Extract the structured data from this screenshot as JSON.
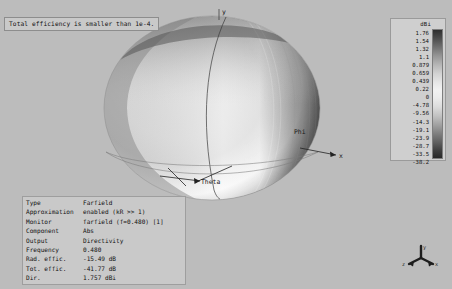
{
  "window": {
    "title": "Farfield 3D Plot"
  },
  "warning": {
    "text": "Total efficiency is smaller than 1e-4."
  },
  "plot": {
    "axis_labels": {
      "phi": "Phi",
      "theta": "Theta",
      "x": "x",
      "y": "y"
    },
    "triad": {
      "x": "x",
      "y": "y",
      "z": "z"
    }
  },
  "legend": {
    "title": "dBi",
    "ticks": [
      "1.76",
      "1.54",
      "1.32",
      "1.1",
      "0.879",
      "0.659",
      "0.439",
      "0.22",
      "0",
      "-4.78",
      "-9.56",
      "-14.3",
      "-19.1",
      "-23.9",
      "-28.7",
      "-33.5",
      "-38.2"
    ]
  },
  "parameters": {
    "rows": [
      {
        "label": "Type",
        "value": "Farfield"
      },
      {
        "label": "Approximation",
        "value": "enabled (kR >> 1)"
      },
      {
        "label": "Monitor",
        "value": "farfield (f=0.480) [1]"
      },
      {
        "label": "Component",
        "value": "Abs"
      },
      {
        "label": "Output",
        "value": "Directivity"
      },
      {
        "label": "Frequency",
        "value": "0.480"
      },
      {
        "label": "Rad. effic.",
        "value": "-15.49 dB"
      },
      {
        "label": "Tot. effic.",
        "value": "-41.77 dB"
      },
      {
        "label": "Dir.",
        "value": "1.757 dBi"
      }
    ]
  },
  "chart_data": {
    "type": "heatmap",
    "colormap": "grayscale",
    "units": "dBi",
    "colorbar_max": 1.76,
    "colorbar_min": -38.2,
    "colorbar_ticks": [
      1.76,
      1.54,
      1.32,
      1.1,
      0.879,
      0.659,
      0.439,
      0.22,
      0,
      -4.78,
      -9.56,
      -14.3,
      -19.1,
      -23.9,
      -28.7,
      -33.5,
      -38.2
    ],
    "peak_directivity_dbi": 1.757,
    "radiation_efficiency_db": -15.49,
    "total_efficiency_db": -41.77,
    "frequency": 0.48,
    "xlabel": "x",
    "ylabel": "y",
    "annotations": [
      "Phi",
      "Theta"
    ],
    "legend_position": "right",
    "grid": false
  }
}
